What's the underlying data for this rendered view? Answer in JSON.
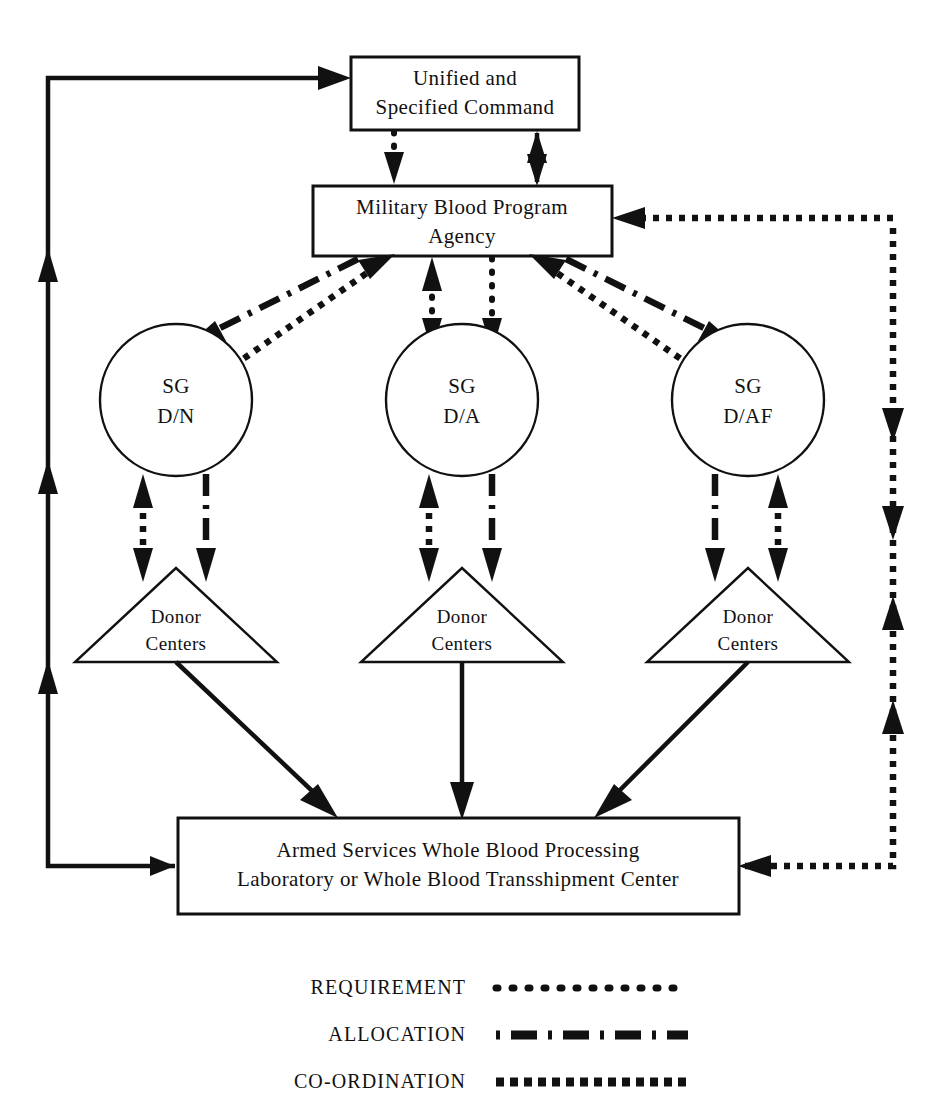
{
  "diagram": {
    "title_fragment_top": "",
    "nodes": [
      {
        "id": "unified-command",
        "shape": "rect",
        "lines": [
          "Unified and",
          "Specified Command"
        ]
      },
      {
        "id": "mbpa",
        "shape": "rect",
        "lines": [
          "Military Blood Program",
          "Agency"
        ]
      },
      {
        "id": "sg-dn",
        "shape": "circle",
        "lines": [
          "SG",
          "D/N"
        ]
      },
      {
        "id": "sg-da",
        "shape": "circle",
        "lines": [
          "SG",
          "D/A"
        ]
      },
      {
        "id": "sg-daf",
        "shape": "circle",
        "lines": [
          "SG",
          "D/AF"
        ]
      },
      {
        "id": "donor-centers-1",
        "shape": "triangle",
        "lines": [
          "Donor",
          "Centers"
        ]
      },
      {
        "id": "donor-centers-2",
        "shape": "triangle",
        "lines": [
          "Donor",
          "Centers"
        ]
      },
      {
        "id": "donor-centers-3",
        "shape": "triangle",
        "lines": [
          "Donor",
          "Centers"
        ]
      },
      {
        "id": "aswbpl",
        "shape": "rect",
        "lines": [
          "Armed Services Whole Blood Processing",
          "Laboratory or Whole Blood Transshipment Center"
        ]
      }
    ]
  },
  "legend": {
    "items": [
      {
        "id": "requirement",
        "label": "REQUIREMENT",
        "style": "dotted-round"
      },
      {
        "id": "allocation",
        "label": "ALLOCATION",
        "style": "dash-dot"
      },
      {
        "id": "co-ordination",
        "label": "CO-ORDINATION",
        "style": "dotted-square"
      }
    ]
  },
  "colors": {
    "ink": "#111111",
    "paper": "#ffffff"
  }
}
